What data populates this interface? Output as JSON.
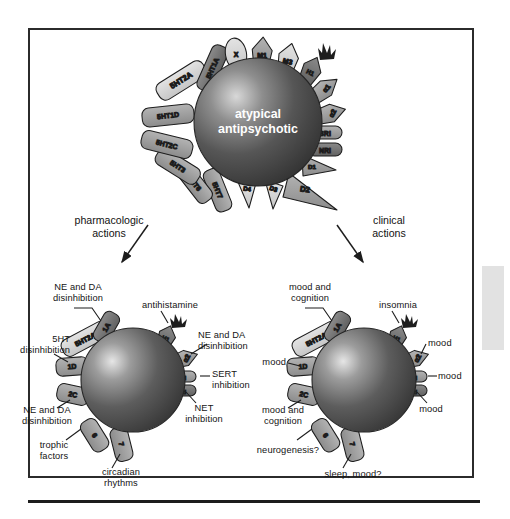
{
  "figure": {
    "core_label_top": "atypical\nantipsychotic",
    "flow_left": "pharmacologic\nactions",
    "flow_right": "clinical\nactions"
  },
  "colors": {
    "sphere_dark": "#3f3f3f",
    "sphere_light": "#cfcfcf",
    "receptor_gray": "#9a9a9a",
    "receptor_light": "#d5d5d5",
    "receptor_dark": "#6e6e6e",
    "outline": "#1d1d1d",
    "text": "#141414",
    "frame": "#2b2b2b",
    "tab": "#e2e2e2"
  },
  "top_molecule": {
    "core": "atypical antipsychotic",
    "receptors": [
      {
        "id": "5HT2A",
        "label": "5HT2A",
        "shape": "rounded-bar",
        "tone": "light"
      },
      {
        "id": "5HT1A",
        "label": "5HT1A",
        "shape": "rounded-bar",
        "tone": "dark"
      },
      {
        "id": "X",
        "label": "X",
        "shape": "oval",
        "tone": "light"
      },
      {
        "id": "M1",
        "label": "M1",
        "shape": "pentagon",
        "tone": "mid"
      },
      {
        "id": "M3",
        "label": "M3",
        "shape": "pentagon",
        "tone": "light"
      },
      {
        "id": "H1",
        "label": "H1",
        "shape": "flame",
        "tone": "dark"
      },
      {
        "id": "alpha1",
        "label": "α1",
        "shape": "arrow",
        "tone": "mid"
      },
      {
        "id": "alpha2",
        "label": "α2",
        "shape": "arrow",
        "tone": "mid"
      },
      {
        "id": "SRI",
        "label": "SRI",
        "shape": "capsule",
        "tone": "mid"
      },
      {
        "id": "NRI",
        "label": "NRI",
        "shape": "capsule",
        "tone": "dark"
      },
      {
        "id": "D1",
        "label": "D1",
        "shape": "triangle",
        "tone": "mid"
      },
      {
        "id": "D2",
        "label": "D2",
        "shape": "big-triangle",
        "tone": "mid"
      },
      {
        "id": "D3",
        "label": "D3",
        "shape": "triangle",
        "tone": "light"
      },
      {
        "id": "D4",
        "label": "D4",
        "shape": "triangle",
        "tone": "light"
      },
      {
        "id": "5HT7",
        "label": "5HT7",
        "shape": "rounded-bar",
        "tone": "mid"
      },
      {
        "id": "5HT6",
        "label": "5HT6",
        "shape": "rounded-bar",
        "tone": "mid"
      },
      {
        "id": "5HT3",
        "label": "5HT3",
        "shape": "rounded-bar",
        "tone": "mid"
      },
      {
        "id": "5HT2C",
        "label": "5HT2C",
        "shape": "rounded-bar",
        "tone": "mid"
      },
      {
        "id": "5HT1D",
        "label": "5HT1D",
        "shape": "rounded-bar",
        "tone": "mid"
      }
    ]
  },
  "left_molecule": {
    "caption": "pharmacologic actions",
    "receptors": [
      {
        "id": "5HT2A",
        "label": "5HT2A"
      },
      {
        "id": "1A",
        "label": "1A"
      },
      {
        "id": "H1",
        "label": "H1"
      },
      {
        "id": "alpha2",
        "label": "α2"
      },
      {
        "id": "SRI",
        "label": "SRI"
      },
      {
        "id": "NRI",
        "label": "NRI"
      },
      {
        "id": "1D",
        "label": "1D"
      },
      {
        "id": "2C",
        "label": "2C"
      },
      {
        "id": "6",
        "label": "6"
      },
      {
        "id": "7",
        "label": "7"
      }
    ],
    "annotations": [
      {
        "id": "ne-da-top",
        "text": "NE and DA\ndisinhibition"
      },
      {
        "id": "5ht-disinhibition",
        "text": "5HT\ndisinhibition"
      },
      {
        "id": "ne-da-left",
        "text": "NE and DA\ndisinhibition"
      },
      {
        "id": "trophic-factors",
        "text": "trophic\nfactors"
      },
      {
        "id": "circadian-rhythms",
        "text": "circadian\nrhythms"
      },
      {
        "id": "antihistamine",
        "text": "antihistamine"
      },
      {
        "id": "ne-da-right",
        "text": "NE and DA\ndisinhibition"
      },
      {
        "id": "sert-inhibition",
        "text": "SERT\ninhibition"
      },
      {
        "id": "net-inhibition",
        "text": "NET\ninhibition"
      }
    ]
  },
  "right_molecule": {
    "caption": "clinical actions",
    "receptors": [
      {
        "id": "5HT2A",
        "label": "5HT2A"
      },
      {
        "id": "1A",
        "label": "1A"
      },
      {
        "id": "H1",
        "label": "H1"
      },
      {
        "id": "alpha2",
        "label": "α2"
      },
      {
        "id": "SRI",
        "label": "SRI"
      },
      {
        "id": "NRI",
        "label": "NRI"
      },
      {
        "id": "1D",
        "label": "1D"
      },
      {
        "id": "2C",
        "label": "2C"
      },
      {
        "id": "6",
        "label": "6"
      },
      {
        "id": "7",
        "label": "7"
      }
    ],
    "annotations": [
      {
        "id": "mood-cognition-top",
        "text": "mood and\ncognition"
      },
      {
        "id": "mood-left",
        "text": "mood"
      },
      {
        "id": "mood-cognition-left",
        "text": "mood and\ncognition"
      },
      {
        "id": "neurogenesis",
        "text": "neurogenesis?"
      },
      {
        "id": "sleep-mood",
        "text": "sleep, mood?"
      },
      {
        "id": "insomnia",
        "text": "insomnia"
      },
      {
        "id": "mood-alpha2",
        "text": "mood"
      },
      {
        "id": "mood-sri",
        "text": "mood"
      },
      {
        "id": "mood-nri",
        "text": "mood"
      }
    ]
  }
}
